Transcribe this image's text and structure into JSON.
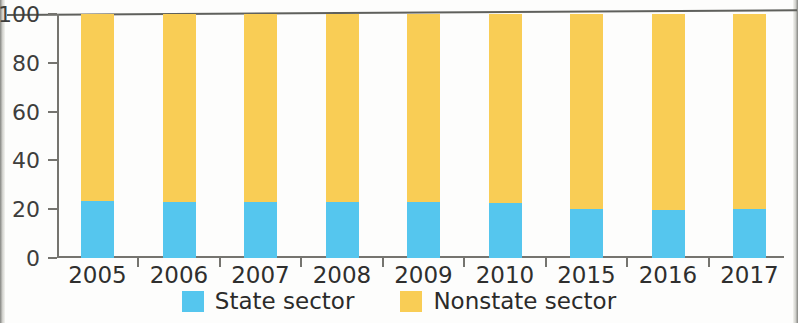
{
  "chart_data": {
    "type": "bar",
    "stacked": true,
    "title": "",
    "subtitle": "",
    "xlabel": "",
    "ylabel": "",
    "categories": [
      "2005",
      "2006",
      "2007",
      "2008",
      "2009",
      "2010",
      "2015",
      "2016",
      "2017"
    ],
    "series": [
      {
        "name": "State sector",
        "color": "#55C6EE",
        "values": [
          23.2,
          23.1,
          22.9,
          22.9,
          23.0,
          22.4,
          20.0,
          19.8,
          20.2
        ]
      },
      {
        "name": "Nonstate sector",
        "color": "#F9CD55",
        "values": [
          76.8,
          76.9,
          77.1,
          77.1,
          77.0,
          77.6,
          80.0,
          80.2,
          79.8
        ]
      }
    ],
    "ylim": [
      0,
      100
    ],
    "yticks": [
      0,
      20,
      40,
      60,
      80,
      100
    ],
    "ytick_labels": [
      "0",
      "20",
      "40",
      "60",
      "80",
      "100"
    ],
    "grid": false,
    "legend_position": "bottom"
  },
  "legend": {
    "items": [
      {
        "label": "State sector",
        "color": "#55C6EE"
      },
      {
        "label": "Nonstate sector",
        "color": "#F9CD55"
      }
    ]
  },
  "colors": {
    "state_sector": "#55C6EE",
    "nonstate_sector": "#F9CD55",
    "axis": "#75746F",
    "text": "#2F2F2E",
    "background": "#FDFDFC"
  }
}
